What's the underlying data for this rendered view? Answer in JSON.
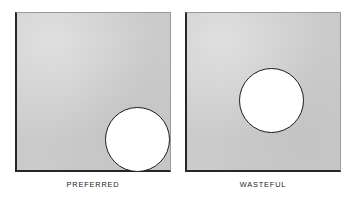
{
  "figure": {
    "type": "comparison-diagram",
    "panel_fill_color": "#cbcbcb",
    "blank_fill_color": "#ffffff",
    "outline_color": "#1d1d1d",
    "shadow_edge_color": "#262626",
    "light_edge_color": "#9a9a9a",
    "panels": [
      {
        "caption": "PREFERRED",
        "blank_shape": "circle",
        "blank_placement": "bottom-right-corner"
      },
      {
        "caption": "WASTEFUL",
        "blank_shape": "circle",
        "blank_placement": "center"
      }
    ]
  }
}
